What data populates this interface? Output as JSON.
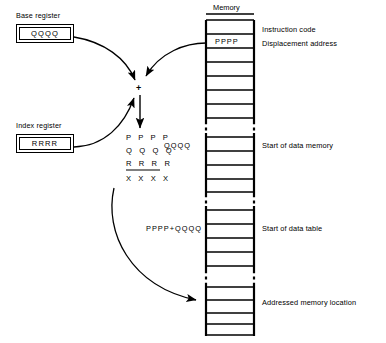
{
  "diagram": {
    "memory_column_title": "Memory"
  },
  "registers": [
    {
      "caption": "Base register",
      "value": "QQQQ",
      "name": "base-register"
    },
    {
      "caption": "Index register",
      "value": "RRRR",
      "name": "index-register"
    }
  ],
  "adder": {
    "symbol": "+"
  },
  "sum": {
    "operands": [
      "P P P P",
      "Q Q Q Q",
      "R R R R"
    ],
    "result": "X X X X"
  },
  "memory_labels": {
    "instruction_code": "Instruction code",
    "displacement_address": "Displacement address",
    "start_of_data_memory": "Start of data memory",
    "start_of_data_table": "Start of data table",
    "addressed_memory_location": "Addressed memory location"
  },
  "memory_cells": {
    "displacement_value": "PPPP",
    "data_memory_address": "QQQQ",
    "data_table_address": "PPPP+QQQQ"
  },
  "colors": {
    "ink": "#000000",
    "paper": "#ffffff"
  }
}
